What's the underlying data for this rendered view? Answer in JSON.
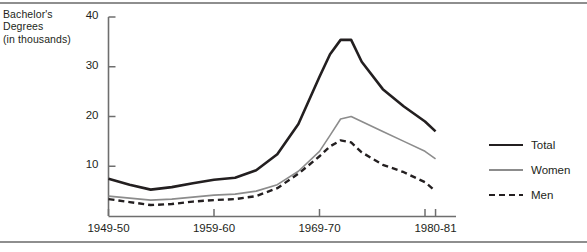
{
  "axis_title_lines": [
    "Bachelor's",
    "Degrees",
    "(in thousands)"
  ],
  "colors": {
    "total": "#231f20",
    "women": "#8c8c8c",
    "men": "#231f20",
    "axis": "#6e6e6e",
    "rule": "#8e8e8e"
  },
  "legend": {
    "items": [
      {
        "label": "Total",
        "key": "total",
        "style": "solid-thick",
        "color": "#231f20"
      },
      {
        "label": "Women",
        "key": "women",
        "style": "solid-thin",
        "color": "#8c8c8c"
      },
      {
        "label": "Men",
        "key": "men",
        "style": "dashed",
        "color": "#231f20"
      }
    ]
  },
  "chart_data": {
    "type": "line",
    "title": "",
    "xlabel": "",
    "ylabel": "Bachelor's Degrees (in thousands)",
    "ylim": [
      0,
      40
    ],
    "yticks": [
      10,
      20,
      30,
      40
    ],
    "ytick_labels": [
      "10",
      "20",
      "30",
      "40"
    ],
    "xlim": [
      1949,
      1981
    ],
    "xticks": [
      1949,
      1959,
      1969,
      1979,
      1980
    ],
    "xtick_labels": [
      "1949-50",
      "1959-60",
      "1969-70",
      "",
      "1980-81"
    ],
    "visible_xtick_labels": [
      "1949-50",
      "1959-60",
      "1969-70",
      "1980-81"
    ],
    "grid": false,
    "legend_position": "right",
    "x": [
      1949,
      1951,
      1953,
      1955,
      1957,
      1959,
      1961,
      1963,
      1965,
      1967,
      1969,
      1970,
      1971,
      1972,
      1973,
      1975,
      1977,
      1979,
      1980
    ],
    "series": [
      {
        "name": "Total",
        "style": "solid-thick",
        "color": "#231f20",
        "values": [
          7.5,
          6.3,
          5.3,
          5.8,
          6.6,
          7.3,
          7.7,
          9.2,
          12.4,
          18.5,
          28.0,
          32.5,
          35.4,
          35.4,
          31.0,
          25.5,
          22.0,
          19.0,
          17.0
        ]
      },
      {
        "name": "Women",
        "style": "solid-thin",
        "color": "#8c8c8c",
        "values": [
          4.0,
          3.6,
          3.2,
          3.4,
          3.8,
          4.2,
          4.4,
          5.0,
          6.3,
          9.0,
          13.0,
          16.2,
          19.5,
          20.0,
          19.0,
          17.0,
          15.0,
          13.0,
          11.5
        ]
      },
      {
        "name": "Men",
        "style": "dashed",
        "color": "#231f20",
        "values": [
          3.4,
          2.8,
          2.2,
          2.4,
          2.9,
          3.2,
          3.4,
          4.0,
          5.6,
          8.5,
          12.0,
          14.0,
          15.2,
          14.8,
          12.8,
          10.3,
          8.8,
          6.8,
          5.0
        ]
      }
    ]
  }
}
